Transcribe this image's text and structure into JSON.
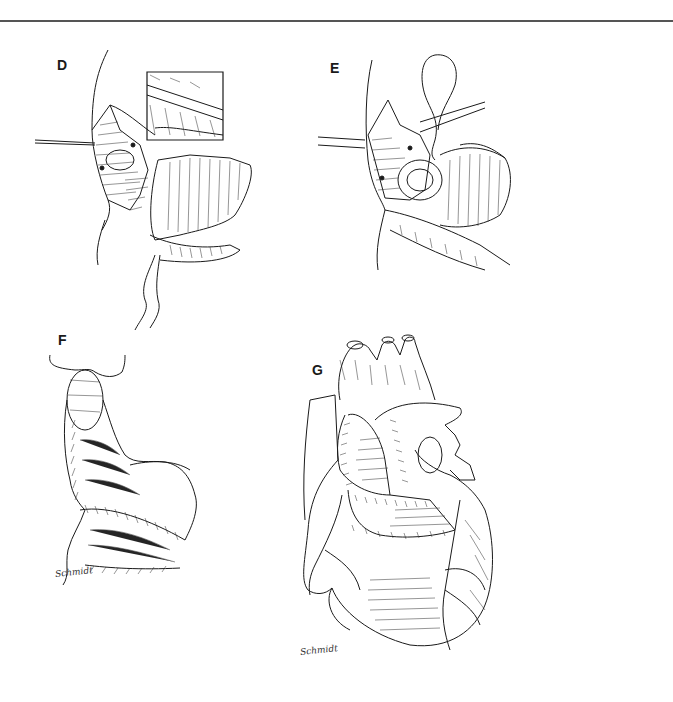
{
  "page": {
    "figure_panels": [
      {
        "label": "D",
        "description": "Surgical view with retracted atrium, inset detail of suture line, and pericardial patch with trailing suture"
      },
      {
        "label": "E",
        "description": "Surgical view with retracted atrial wall, exposed valve, and patch sutured along margin"
      },
      {
        "label": "F",
        "description": "Completed patch closure sutured along atrial and ventricular margins"
      },
      {
        "label": "G",
        "description": "Anterior view of whole heart showing completed patch repair with suture lines"
      }
    ],
    "signatures": {
      "panel_f": "Schmidt",
      "panel_g": "Schmidt"
    },
    "colors": {
      "ink": "#1a1a1a",
      "paper": "#ffffff",
      "rule": "#555555"
    }
  }
}
